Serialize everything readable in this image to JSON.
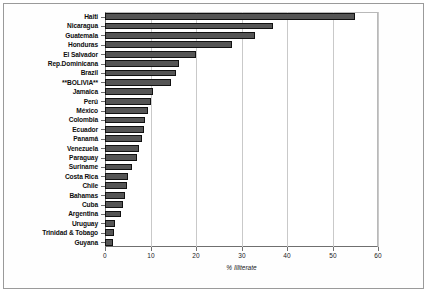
{
  "chart_data": {
    "type": "bar",
    "orientation": "horizontal",
    "title": "",
    "xlabel": "% Illiterate",
    "ylabel": "",
    "xlim": [
      0,
      60
    ],
    "xticks": [
      0,
      10,
      20,
      30,
      40,
      50,
      60
    ],
    "grid": true,
    "legend": false,
    "bar_color": "#555555",
    "bar_edge_color": "#111111",
    "categories": [
      "Haiti",
      "Nicaragua",
      "Guatemala",
      "Honduras",
      "El Salvador",
      "Rep.Dominicana",
      "Brazil",
      "**BOLIVIA**",
      "Jamaica",
      "Perú",
      "México",
      "Colombia",
      "Ecuador",
      "Panamá",
      "Venezuela",
      "Paraguay",
      "Suriname",
      "Costa Rica",
      "Chile",
      "Bahamas",
      "Cuba",
      "Argentina",
      "Uruguay",
      "Trinidad & Tobago",
      "Guyana"
    ],
    "values": [
      55,
      37,
      33,
      28,
      20,
      16.2,
      15.5,
      14.5,
      10.5,
      10.2,
      9.5,
      8.7,
      8.5,
      8.2,
      7.5,
      7,
      6,
      5,
      4.8,
      4.5,
      4,
      3.5,
      2.3,
      2,
      1.7
    ]
  }
}
